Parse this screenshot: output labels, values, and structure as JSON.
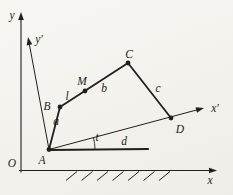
{
  "figure": {
    "background": "#f6f5f1",
    "ink": "#1f1f1f",
    "width": 233,
    "height": 195,
    "axes": [
      {
        "id": "x-axis",
        "from": [
          19,
          170.5
        ],
        "to": [
          217,
          170.5
        ],
        "label": "x",
        "label_at": [
          210,
          184
        ],
        "width": 1.1
      },
      {
        "id": "y-axis",
        "from": [
          21,
          172.5
        ],
        "to": [
          21,
          12
        ],
        "label": "y",
        "label_at": [
          12,
          19
        ],
        "width": 1.1
      },
      {
        "id": "x-prime-axis",
        "from": [
          49,
          149.5
        ],
        "to": [
          204,
          108
        ],
        "label": "x′",
        "label_at": [
          215,
          112
        ],
        "width": 1.0
      },
      {
        "id": "y-prime-axis",
        "from": [
          49,
          149.5
        ],
        "to": [
          28,
          37
        ],
        "label": "y′",
        "label_at": [
          39,
          43
        ],
        "width": 1.0
      }
    ],
    "origin_label": {
      "text": "O",
      "at": [
        12,
        167
      ]
    },
    "points": [
      {
        "id": "A",
        "label": "A",
        "at": [
          49,
          149.5
        ],
        "label_at": [
          42,
          164
        ]
      },
      {
        "id": "B",
        "label": "B",
        "at": [
          60,
          107
        ],
        "label_at": [
          47,
          110
        ]
      },
      {
        "id": "M",
        "label": "M",
        "at": [
          85,
          91
        ],
        "label_at": [
          82,
          85
        ]
      },
      {
        "id": "C",
        "label": "C",
        "at": [
          128,
          63
        ],
        "label_at": [
          129,
          58
        ]
      },
      {
        "id": "D",
        "label": "D",
        "at": [
          171,
          118
        ],
        "label_at": [
          180,
          133
        ]
      }
    ],
    "links": [
      {
        "id": "link-a",
        "from": [
          49,
          149.5
        ],
        "to": [
          60,
          107
        ],
        "width": 1.8,
        "labels": [
          {
            "text": "a",
            "at": [
              56,
              125
            ]
          }
        ]
      },
      {
        "id": "link-b",
        "from": [
          60,
          107
        ],
        "to": [
          128,
          63
        ],
        "width": 1.8,
        "labels": [
          {
            "text": "l",
            "at": [
              67,
              100
            ]
          },
          {
            "text": "b",
            "at": [
              104,
              92
            ]
          }
        ]
      },
      {
        "id": "link-c",
        "from": [
          128,
          63
        ],
        "to": [
          171,
          118
        ],
        "width": 1.8,
        "labels": [
          {
            "text": "c",
            "at": [
              158,
              92
            ]
          }
        ]
      },
      {
        "id": "link-d",
        "from": [
          49,
          150
        ],
        "to": [
          148,
          149
        ],
        "width": 2.2,
        "labels": [
          {
            "text": "d",
            "at": [
              124,
              145
            ]
          }
        ]
      }
    ],
    "angle": {
      "label": "t",
      "label_at": [
        97,
        141
      ],
      "cx": 49,
      "cy": 149.5,
      "r": 46,
      "start_deg": 0,
      "end_deg": -15
    },
    "hatch": {
      "count": 7,
      "start_x": 66,
      "spacing": 15.5,
      "dx": 11,
      "y_bottom": 180.5,
      "y_top": 171.5
    }
  }
}
